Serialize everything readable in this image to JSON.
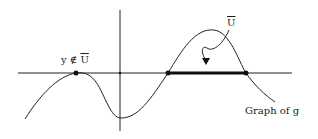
{
  "diagram": {
    "labels": {
      "point_label_prefix": "y ∉ ",
      "point_label_set": "U",
      "set_label": "U",
      "graph_label": "Graph of  g"
    },
    "colors": {
      "ink": "#222222",
      "background": "#ffffff"
    }
  }
}
